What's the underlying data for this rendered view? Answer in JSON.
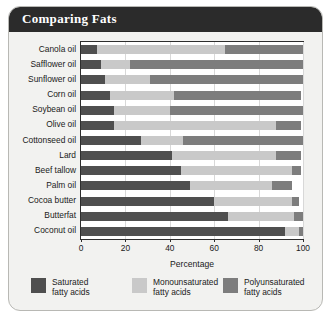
{
  "panel": {
    "title": "Comparing Fats"
  },
  "chart_data": {
    "type": "bar",
    "orientation": "horizontal",
    "stacked": true,
    "title": "Comparing Fats",
    "xlabel": "Percentage",
    "ylabel": "",
    "xlim": [
      0,
      100
    ],
    "xticks": [
      0,
      20,
      40,
      60,
      80,
      100
    ],
    "xticklabels": [
      "0",
      "20",
      "40",
      "60",
      "80",
      "100"
    ],
    "grid": true,
    "legend_position": "bottom",
    "categories": [
      "Canola oil",
      "Safflower oil",
      "Sunflower oil",
      "Corn oil",
      "Soybean oil",
      "Olive oil",
      "Cottonseed oil",
      "Lard",
      "Beef tallow",
      "Palm oil",
      "Cocoa butter",
      "Butterfat",
      "Coconut oil"
    ],
    "series": [
      {
        "name": "Saturated fatty acids",
        "legend_label": "Saturated\nfatty acids",
        "color": "#4f4f4f",
        "values": [
          7,
          9,
          11,
          13,
          15,
          15,
          27,
          41,
          45,
          49,
          60,
          66,
          92
        ]
      },
      {
        "name": "Monounsaturated fatty acids",
        "legend_label": "Monounsaturated\nfatty acids",
        "color": "#c9c9c9",
        "values": [
          58,
          13,
          20,
          29,
          25,
          73,
          19,
          47,
          50,
          37,
          35,
          30,
          6
        ]
      },
      {
        "name": "Polyunsaturated fatty acids",
        "legend_label": "Polyunsaturated\nfatty acids",
        "color": "#7d7d7d",
        "values": [
          35,
          78,
          69,
          57,
          60,
          11,
          54,
          11,
          4,
          9,
          3,
          4,
          2
        ]
      }
    ]
  }
}
